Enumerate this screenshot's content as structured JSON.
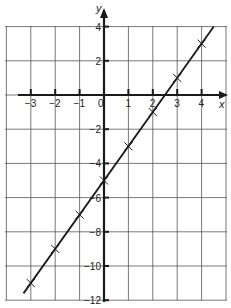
{
  "chart_data": {
    "type": "line",
    "title": "",
    "xlabel": "x",
    "ylabel": "y",
    "xlim": [
      -4,
      5
    ],
    "ylim": [
      -12,
      4
    ],
    "grid": true,
    "x_ticks": [
      -3,
      -2,
      -1,
      0,
      1,
      2,
      3,
      4
    ],
    "x_tick_labels": [
      "−3",
      "−2",
      "−1",
      "0",
      "1",
      "2",
      "3",
      "4"
    ],
    "y_ticks": [
      4,
      2,
      -2,
      -4,
      -6,
      -8,
      -10,
      -12
    ],
    "y_tick_labels": [
      "4",
      "2",
      "−2",
      "−4",
      "−6",
      "−8",
      "−10",
      "−12"
    ],
    "series": [
      {
        "name": "y = 2x − 5",
        "marker": "x",
        "x": [
          -3,
          -2,
          -1,
          0,
          1,
          2,
          3,
          4
        ],
        "y": [
          -11,
          -9,
          -7,
          -5,
          -3,
          -1,
          1,
          3
        ]
      }
    ],
    "line_extent": {
      "x": [
        -3.3,
        4.5
      ],
      "y": [
        -11.6,
        4.0
      ]
    }
  },
  "colors": {
    "ink": "#1a1a1a",
    "grid": "#555555",
    "background": "#ffffff"
  }
}
